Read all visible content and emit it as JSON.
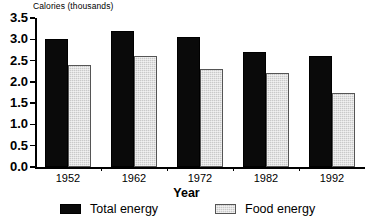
{
  "chart_data": {
    "type": "bar",
    "title": "",
    "xlabel": "Year",
    "ylabel": "Calories (thousands)",
    "categories": [
      "1952",
      "1962",
      "1972",
      "1982",
      "1992"
    ],
    "series": [
      {
        "name": "Total energy",
        "color": "#0a0a0a",
        "values": [
          3.0,
          3.2,
          3.05,
          2.7,
          2.6
        ]
      },
      {
        "name": "Food energy",
        "color": "#c9c9c9",
        "values": [
          2.4,
          2.6,
          2.3,
          2.2,
          1.75
        ]
      }
    ],
    "ylim": [
      0.0,
      3.5
    ],
    "ytick_labels": [
      "3.5",
      "3.0",
      "2.5",
      "2.0",
      "1.5",
      "1.0",
      "0.5",
      "0.0"
    ],
    "ytick_values": [
      3.5,
      3.0,
      2.5,
      2.0,
      1.5,
      1.0,
      0.5,
      0.0
    ],
    "grid": false,
    "legend_position": "bottom"
  },
  "axes": {
    "y_title": "Calories (thousands)",
    "x_title": "Year"
  },
  "legend": {
    "items": [
      {
        "label": "Total energy"
      },
      {
        "label": "Food energy"
      }
    ]
  }
}
